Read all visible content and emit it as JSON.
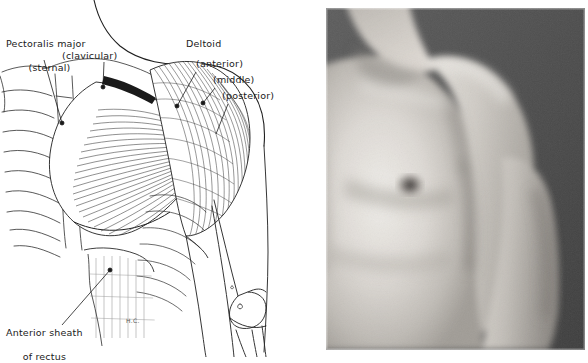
{
  "figure": {
    "background_color": "#ffffff",
    "ink_color": "#1a1a1a",
    "panels": [
      {
        "name": "anatomical-line-drawing",
        "position": "left"
      },
      {
        "name": "torso-photograph",
        "position": "right"
      }
    ]
  },
  "labels": {
    "pectoralis_major": "Pectoralis major",
    "sternal": "(sternal)",
    "clavicular": "(clavicular)",
    "deltoid": "Deltoid",
    "anterior": "(anterior)",
    "middle": "(middle)",
    "posterior": "(posterior)",
    "anterior_sheath_line1": "Anterior sheath",
    "anterior_sheath_line2": "of rectus",
    "artist_signature": "H.C."
  },
  "leader_lines": [
    {
      "name": "leader-pectoralis-sternal",
      "from": [
        44,
        60
      ],
      "to": [
        62,
        123
      ],
      "dot": true
    },
    {
      "name": "leader-pectoralis-clavicular",
      "from": [
        104,
        62
      ],
      "to": [
        103,
        87
      ],
      "dot": true
    },
    {
      "name": "leader-deltoid-anterior",
      "from": [
        196,
        72
      ],
      "to": [
        177,
        106
      ],
      "dot": true
    },
    {
      "name": "leader-deltoid-middle",
      "from": [
        215,
        88
      ],
      "to": [
        203,
        103
      ],
      "dot": true
    },
    {
      "name": "leader-deltoid-posterior",
      "from": [
        228,
        104
      ],
      "to": [
        218,
        132
      ],
      "dot": false
    },
    {
      "name": "leader-anterior-sheath",
      "from": [
        62,
        325
      ],
      "to": [
        110,
        270
      ],
      "dot": true
    }
  ],
  "photo": {
    "description": "grayscale photograph of male torso, right shoulder and chest, dark background",
    "background_color": "#4a4a4a",
    "skin_highlight": "#e8e6e2",
    "skin_midtone": "#b9b6b1",
    "skin_shadow": "#8a8782",
    "nipple_color": "#4e4a46"
  }
}
